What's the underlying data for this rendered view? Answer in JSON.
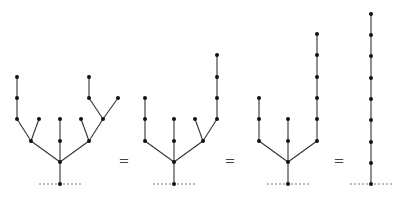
{
  "diagram": {
    "colors": {
      "edge": "#333333",
      "node": "#111111",
      "ground": "#555555"
    },
    "equals_symbol": "=",
    "equals_positions": [
      [
        124,
        160
      ],
      [
        230,
        160
      ],
      [
        339,
        160
      ]
    ],
    "trees": [
      {
        "id": "tree-1",
        "root": [
          60,
          184
        ],
        "ground": [
          39,
          81
        ],
        "nodes": [
          [
            60,
            184
          ],
          [
            60,
            162
          ],
          [
            31,
            141
          ],
          [
            17,
            119
          ],
          [
            17,
            98
          ],
          [
            17,
            77
          ],
          [
            39,
            119
          ],
          [
            60,
            141
          ],
          [
            60,
            119
          ],
          [
            89,
            141
          ],
          [
            81,
            119
          ],
          [
            103,
            119
          ],
          [
            89,
            98
          ],
          [
            89,
            77
          ],
          [
            118,
            98
          ]
        ],
        "edges": [
          [
            0,
            1
          ],
          [
            1,
            2
          ],
          [
            2,
            3
          ],
          [
            3,
            4
          ],
          [
            4,
            5
          ],
          [
            2,
            6
          ],
          [
            1,
            7
          ],
          [
            7,
            8
          ],
          [
            1,
            9
          ],
          [
            9,
            10
          ],
          [
            9,
            11
          ],
          [
            11,
            12
          ],
          [
            12,
            13
          ],
          [
            11,
            14
          ]
        ]
      },
      {
        "id": "tree-2",
        "root": [
          174,
          184
        ],
        "ground": [
          153,
          196
        ],
        "nodes": [
          [
            174,
            184
          ],
          [
            174,
            162
          ],
          [
            145,
            141
          ],
          [
            145,
            119
          ],
          [
            145,
            98
          ],
          [
            174,
            141
          ],
          [
            174,
            119
          ],
          [
            203,
            141
          ],
          [
            195,
            119
          ],
          [
            217,
            119
          ],
          [
            217,
            98
          ],
          [
            217,
            77
          ],
          [
            217,
            55
          ]
        ],
        "edges": [
          [
            0,
            1
          ],
          [
            1,
            2
          ],
          [
            2,
            3
          ],
          [
            3,
            4
          ],
          [
            1,
            5
          ],
          [
            5,
            6
          ],
          [
            1,
            7
          ],
          [
            7,
            8
          ],
          [
            7,
            9
          ],
          [
            9,
            10
          ],
          [
            10,
            11
          ],
          [
            11,
            12
          ]
        ]
      },
      {
        "id": "tree-3",
        "root": [
          288,
          184
        ],
        "ground": [
          267,
          310
        ],
        "nodes": [
          [
            288,
            184
          ],
          [
            288,
            162
          ],
          [
            259,
            141
          ],
          [
            259,
            119
          ],
          [
            259,
            98
          ],
          [
            288,
            141
          ],
          [
            288,
            119
          ],
          [
            317,
            141
          ],
          [
            317,
            119
          ],
          [
            317,
            98
          ],
          [
            317,
            77
          ],
          [
            317,
            55
          ],
          [
            317,
            34
          ]
        ],
        "edges": [
          [
            0,
            1
          ],
          [
            1,
            2
          ],
          [
            2,
            3
          ],
          [
            3,
            4
          ],
          [
            1,
            5
          ],
          [
            5,
            6
          ],
          [
            1,
            7
          ],
          [
            7,
            8
          ],
          [
            8,
            9
          ],
          [
            9,
            10
          ],
          [
            10,
            11
          ],
          [
            11,
            12
          ]
        ]
      },
      {
        "id": "tree-4",
        "root": [
          371,
          184
        ],
        "ground": [
          350,
          392
        ],
        "nodes": [
          [
            371,
            184
          ],
          [
            371,
            163
          ],
          [
            371,
            142
          ],
          [
            371,
            120
          ],
          [
            371,
            99
          ],
          [
            371,
            78
          ],
          [
            371,
            56
          ],
          [
            371,
            35
          ],
          [
            371,
            14
          ]
        ],
        "edges": [
          [
            0,
            1
          ],
          [
            1,
            2
          ],
          [
            2,
            3
          ],
          [
            3,
            4
          ],
          [
            4,
            5
          ],
          [
            5,
            6
          ],
          [
            6,
            7
          ],
          [
            7,
            8
          ]
        ]
      }
    ]
  }
}
